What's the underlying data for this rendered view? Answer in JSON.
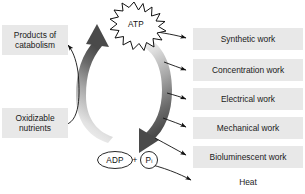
{
  "diagram": {
    "nodes": {
      "atp": {
        "label": "ATP",
        "shape": "starburst-icon"
      },
      "adp": {
        "label": "ADP",
        "shape": "ellipse"
      },
      "plus": {
        "label": "+"
      },
      "phosphate": {
        "label": "P",
        "subscript": "i",
        "shape": "circle"
      }
    },
    "inputs": [
      {
        "id": "oxidizable-nutrients",
        "label": "Oxidizable\nnutrients",
        "line1": "Oxidizable",
        "line2": "nutrients"
      }
    ],
    "outputs_left": [
      {
        "id": "products-of-catabolism",
        "label": "Products of\ncatabolism",
        "line1": "Products of",
        "line2": "catabolism"
      }
    ],
    "work_outputs": [
      {
        "id": "synthetic-work",
        "label": "Synthetic work",
        "boxed": true
      },
      {
        "id": "concentration-work",
        "label": "Concentration work",
        "boxed": true
      },
      {
        "id": "electrical-work",
        "label": "Electrical work",
        "boxed": true
      },
      {
        "id": "mechanical-work",
        "label": "Mechanical work",
        "boxed": true
      },
      {
        "id": "bioluminescent-work",
        "label": "Bioluminescent work",
        "boxed": true
      },
      {
        "id": "heat",
        "label": "Heat",
        "boxed": false
      }
    ],
    "arrows": {
      "left_arc": {
        "name": "adp-to-atp-arrow",
        "direction": "up",
        "description": "thick gradient arrow from ADP + Pi up to ATP"
      },
      "right_arc": {
        "name": "atp-to-adp-arrow",
        "direction": "down",
        "description": "thick gradient arrow from ATP down to ADP + Pi"
      }
    },
    "colors": {
      "box_fill": "#e8e8e8",
      "text": "#1a1a1a",
      "arrow_dark": "#4a4a4a",
      "arrow_light": "#f2f2f2",
      "line": "#111111",
      "background": "#ffffff"
    }
  }
}
